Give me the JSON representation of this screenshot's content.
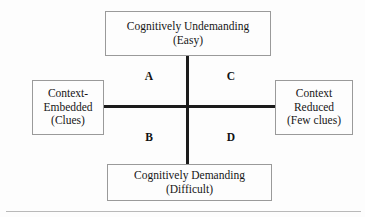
{
  "diagram": {
    "axes": {
      "vertical_label_top": "Cognitively Undemanding",
      "vertical_label_bottom": "Cognitively Demanding",
      "horizontal_label_left": "Context-Embedded",
      "horizontal_label_right": "Context Reduced"
    },
    "boxes": {
      "top": {
        "line1": "Cognitively Undemanding",
        "line2": "(Easy)"
      },
      "bottom": {
        "line1": "Cognitively Demanding",
        "line2": "(Difficult)"
      },
      "left": {
        "line1": "Context-",
        "line2": "Embedded",
        "line3": "(Clues)"
      },
      "right": {
        "line1": "Context",
        "line2": "Reduced",
        "line3": "(Few clues)"
      }
    },
    "quadrants": {
      "upper_left": "A",
      "upper_right": "C",
      "lower_left": "B",
      "lower_right": "D"
    },
    "colors": {
      "background": "#fdfdfd",
      "axis_line": "#1b1b1b",
      "box_border": "#9a9a9a",
      "text": "#161616",
      "footer_rule": "#b9b9b9"
    }
  }
}
